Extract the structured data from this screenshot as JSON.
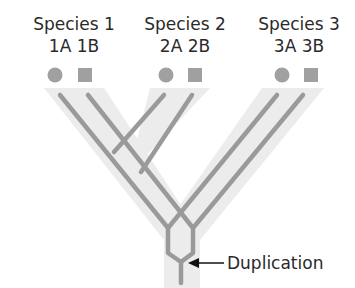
{
  "diagram": {
    "type": "gene-tree-in-species-tree",
    "species": [
      {
        "name": "Species 1",
        "genes": [
          "1A",
          "1B"
        ],
        "gene_label": "1A 1B"
      },
      {
        "name": "Species 2",
        "genes": [
          "2A",
          "2B"
        ],
        "gene_label": "2A 2B"
      },
      {
        "name": "Species 3",
        "genes": [
          "3A",
          "3B"
        ],
        "gene_label": "3A 3B"
      }
    ],
    "gene_markers": {
      "A": "circle",
      "B": "square"
    },
    "annotation": {
      "text": "Duplication",
      "arrow": "left-arrow"
    },
    "colors": {
      "species_tree_fill": "#ececec",
      "gene_line": "#9a9a9a",
      "marker": "#a0a0a0",
      "text": "#2a2a2a"
    }
  }
}
